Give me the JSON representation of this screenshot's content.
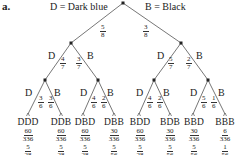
{
  "part_label": "a.",
  "legend": {
    "left": "D = Dark blue",
    "right": "B = Black"
  },
  "level1": [
    {
      "letter": "",
      "num": "5",
      "den": "8"
    },
    {
      "letter": "",
      "num": "3",
      "den": "8"
    }
  ],
  "level2": [
    {
      "letter": "D",
      "num": "4",
      "den": "7"
    },
    {
      "letter": "B",
      "num": "3",
      "den": "7"
    },
    {
      "letter": "D",
      "num": "5",
      "den": "7"
    },
    {
      "letter": "B",
      "num": "2",
      "den": "7"
    }
  ],
  "level3": [
    {
      "letter": "D",
      "num": "3",
      "den": "6"
    },
    {
      "letter": "B",
      "num": "3",
      "den": "6"
    },
    {
      "letter": "D",
      "num": "4",
      "den": "6"
    },
    {
      "letter": "B",
      "num": "2",
      "den": "6"
    },
    {
      "letter": "D",
      "num": "4",
      "den": "6"
    },
    {
      "letter": "B",
      "num": "2",
      "den": "6"
    },
    {
      "letter": "D",
      "num": "5",
      "den": "6"
    },
    {
      "letter": "B",
      "num": "1",
      "den": "6"
    }
  ],
  "outcomes": [
    {
      "label": "DDD",
      "p_num": "60",
      "p_den": "336",
      "s_num": "5",
      "s_den": "28"
    },
    {
      "label": "DDB",
      "p_num": "60",
      "p_den": "336",
      "s_num": "5",
      "s_den": "28"
    },
    {
      "label": "DBD",
      "p_num": "60",
      "p_den": "336",
      "s_num": "5",
      "s_den": "28"
    },
    {
      "label": "DBB",
      "p_num": "30",
      "p_den": "336",
      "s_num": "5",
      "s_den": "56"
    },
    {
      "label": "BDD",
      "p_num": "60",
      "p_den": "336",
      "s_num": "5",
      "s_den": "28"
    },
    {
      "label": "BDB",
      "p_num": "30",
      "p_den": "336",
      "s_num": "5",
      "s_den": "56"
    },
    {
      "label": "BBD",
      "p_num": "30",
      "p_den": "336",
      "s_num": "5",
      "s_den": "56"
    },
    {
      "label": "BBB",
      "p_num": "6",
      "p_den": "336",
      "s_num": "1",
      "s_den": "56"
    }
  ]
}
